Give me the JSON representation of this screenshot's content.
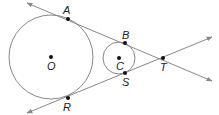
{
  "diagram": {
    "colors": {
      "stroke": "#888888",
      "point": "#111111",
      "label": "#222222",
      "background": "#ffffff"
    },
    "circles": [
      {
        "name": "O",
        "cx": 51,
        "cy": 57,
        "r": 42
      },
      {
        "name": "C",
        "cx": 119,
        "cy": 58,
        "r": 16
      }
    ],
    "lines": [
      {
        "name": "tangent-ABT",
        "x1": 27,
        "y1": 3,
        "x2": 212,
        "y2": 81
      },
      {
        "name": "tangent-RST",
        "x1": 27,
        "y1": 113,
        "x2": 212,
        "y2": 37
      }
    ],
    "points": [
      {
        "label": "A",
        "x": 68,
        "y": 19,
        "lx": 63,
        "ly": 14
      },
      {
        "label": "B",
        "x": 125,
        "y": 43,
        "lx": 122,
        "ly": 39
      },
      {
        "label": "O",
        "x": 51,
        "y": 57,
        "lx": 47,
        "ly": 70
      },
      {
        "label": "C",
        "x": 119,
        "y": 58,
        "lx": 116,
        "ly": 70
      },
      {
        "label": "T",
        "x": 163,
        "y": 58,
        "lx": 160,
        "ly": 71
      },
      {
        "label": "S",
        "x": 125,
        "y": 73,
        "lx": 122,
        "ly": 86
      },
      {
        "label": "R",
        "x": 68,
        "y": 98,
        "lx": 63,
        "ly": 111
      }
    ]
  }
}
